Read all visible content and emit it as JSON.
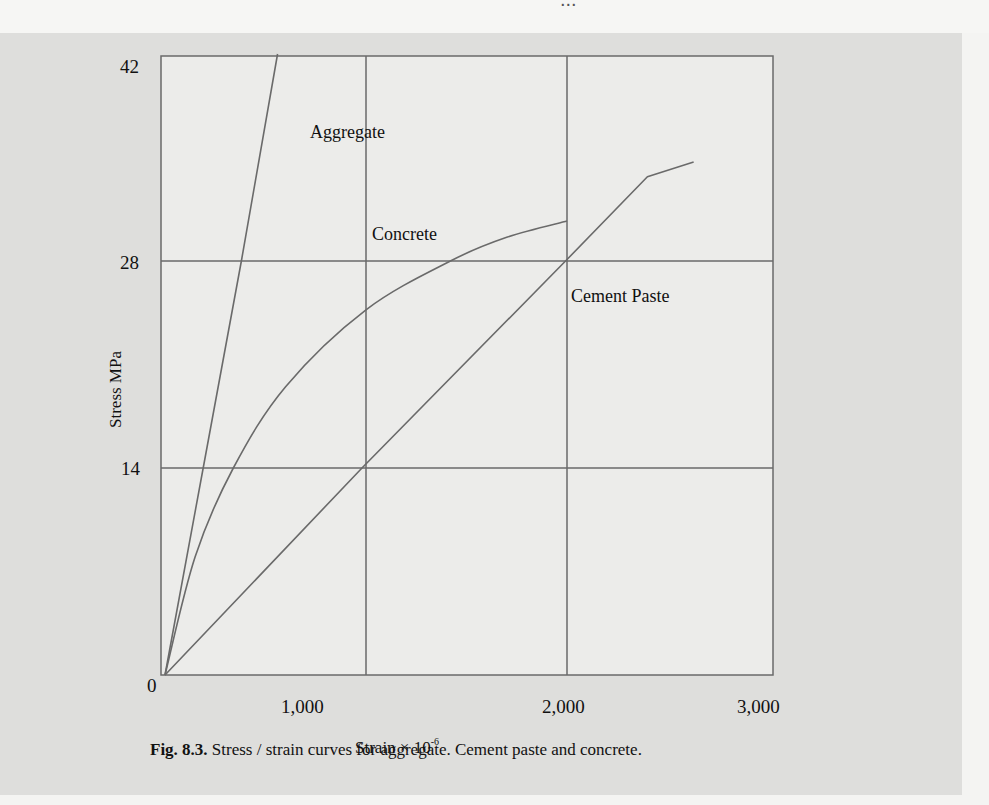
{
  "page": {
    "top_strip_text": "...",
    "colors": {
      "panel_bg": "#dededc",
      "plot_bg": "#ececea",
      "line": "#6a6a6a",
      "text": "#111111"
    }
  },
  "figure": {
    "caption_number": "Fig. 8.3.",
    "caption_text": "Stress / strain curves for aggregate. Cement paste and concrete."
  },
  "chart_data": {
    "type": "line",
    "title": "Stress / strain curves for aggregate. Cement paste and concrete.",
    "xlabel": "Strain × 10⁻⁶",
    "xlabel_base": "Strain × 10",
    "xlabel_exp": "-6",
    "ylabel": "Stress MPa",
    "xlim": [
      0,
      3000
    ],
    "ylim": [
      0,
      42
    ],
    "x_ticks": [
      0,
      1000,
      2000,
      3000
    ],
    "x_tick_labels": [
      "0",
      "1,000",
      "2,000",
      "3,000"
    ],
    "y_ticks": [
      0,
      14,
      28,
      42
    ],
    "y_tick_labels": [
      "0",
      "14",
      "28",
      "42"
    ],
    "grid": true,
    "legend": "inline labels",
    "series": [
      {
        "name": "Aggregate",
        "points": [
          [
            0,
            0
          ],
          [
            190,
            14
          ],
          [
            380,
            28
          ],
          [
            560,
            42
          ]
        ]
      },
      {
        "name": "Concrete",
        "points": [
          [
            0,
            0
          ],
          [
            150,
            8
          ],
          [
            340,
            14
          ],
          [
            600,
            19.5
          ],
          [
            1000,
            24.7
          ],
          [
            1420,
            28
          ],
          [
            1700,
            29.6
          ],
          [
            2000,
            30.7
          ]
        ]
      },
      {
        "name": "Cement Paste",
        "points": [
          [
            0,
            0
          ],
          [
            980,
            14
          ],
          [
            2000,
            28.1
          ],
          [
            2400,
            33.7
          ],
          [
            2630,
            34.7
          ]
        ]
      }
    ],
    "annotations": [
      {
        "text": "Aggregate",
        "x": 720,
        "y": 37.5
      },
      {
        "text": "Concrete",
        "x": 1030,
        "y": 30.7
      },
      {
        "text": "Cement Paste",
        "x": 2020,
        "y": 25.7
      }
    ]
  }
}
